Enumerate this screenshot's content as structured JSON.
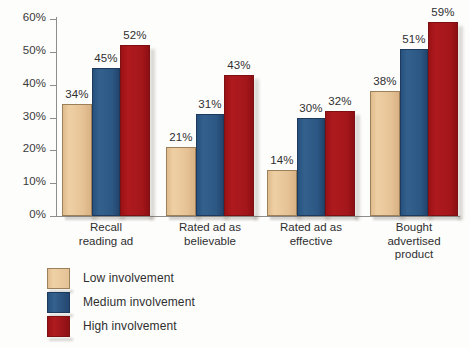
{
  "chart_data": {
    "type": "bar",
    "title": "",
    "subtitle": "",
    "xlabel": "",
    "ylabel": "",
    "ylim": [
      0,
      60
    ],
    "y_tick_labels": [
      "0%",
      "10%",
      "20%",
      "30%",
      "40%",
      "50%",
      "60%"
    ],
    "y_tick_values": [
      0,
      10,
      20,
      30,
      40,
      50,
      60
    ],
    "grid": false,
    "legend_position": "bottom-left",
    "categories": [
      "Recall reading ad",
      "Rated ad as believable",
      "Rated ad as effective",
      "Bought advertised product"
    ],
    "category_lines": [
      [
        "Recall",
        "reading ad"
      ],
      [
        "Rated ad as",
        "believable"
      ],
      [
        "Rated ad as",
        "effective"
      ],
      [
        "Bought",
        "advertised",
        "product"
      ]
    ],
    "series": [
      {
        "name": "Low involvement",
        "color": "#e5c295",
        "values": [
          34,
          21,
          14,
          38
        ],
        "value_labels": [
          "34%",
          "21%",
          "14%",
          "38%"
        ]
      },
      {
        "name": "Medium involvement",
        "color": "#2c5784",
        "values": [
          45,
          31,
          30,
          51
        ],
        "value_labels": [
          "45%",
          "31%",
          "30%",
          "51%"
        ]
      },
      {
        "name": "High involvement",
        "color": "#a4161a",
        "values": [
          52,
          43,
          32,
          59
        ],
        "value_labels": [
          "52%",
          "43%",
          "32%",
          "59%"
        ]
      }
    ]
  },
  "legend": {
    "items": [
      {
        "label": "Low involvement",
        "swatch": "low-involvement-swatch"
      },
      {
        "label": "Medium involvement",
        "swatch": "medium-involvement-swatch"
      },
      {
        "label": "High involvement",
        "swatch": "high-involvement-swatch"
      }
    ]
  }
}
